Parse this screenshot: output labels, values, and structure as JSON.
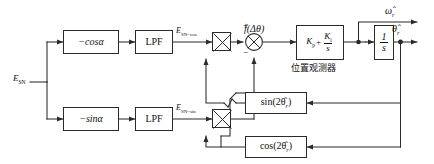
{
  "diagram": {
    "input": {
      "label": "E",
      "sub": "SN"
    },
    "blocks": {
      "neg_cos": "−cosα",
      "neg_sin": "−sinα",
      "lpf_top": "LPF",
      "lpf_bottom": "LPF",
      "pi_kp": "K",
      "pi_kp_sub": "p",
      "pi_ki": "K",
      "pi_ki_sub": "i",
      "pi_den": "s",
      "pi_plus": "+",
      "integrator_num": "1",
      "integrator_den": "s",
      "observer_caption": "位置观测器",
      "sin_feedback": "sin(2θ̂",
      "sin_feedback_sub": "r",
      "sin_feedback_end": ")",
      "cos_feedback": "cos(2θ̂",
      "cos_feedback_sub": "r",
      "cos_feedback_end": ")"
    },
    "signals": {
      "e_sn_cos": "E",
      "e_sn_cos_sub": "SN−cos",
      "e_sn_sin": "E",
      "e_sn_sin_sub": "SN−sin",
      "f_delta_theta": "f(Δθ)",
      "omega_hat": "ω̂",
      "omega_hat_sub": "r",
      "theta_hat": "θ̂",
      "theta_hat_sub": "r"
    },
    "summing_junction": {
      "plus_sign": "+",
      "minus_sign": "−"
    },
    "multipliers": {
      "top": "multiply",
      "bottom": "multiply"
    },
    "colors": {
      "line": "#2a2a2a",
      "text": "#111111",
      "background": "#ffffff"
    }
  }
}
